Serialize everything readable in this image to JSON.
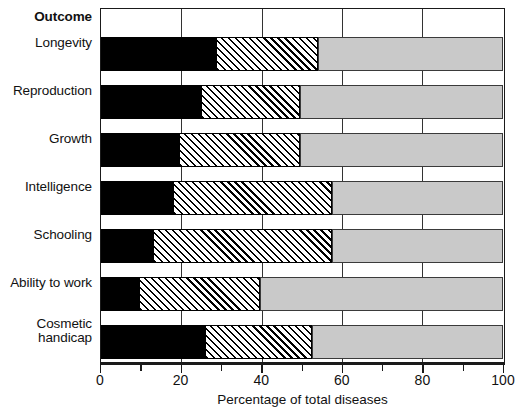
{
  "chart_data": {
    "type": "bar",
    "subtype": "horizontal-stacked",
    "title": "",
    "xlabel": "Percentage of total diseases",
    "ylabel": "Outcome",
    "categories": [
      "Longevity",
      "Reproduction",
      "Growth",
      "Intelligence",
      "Schooling",
      "Ability to work",
      "Cosmetic\nhandicap"
    ],
    "series": [
      {
        "name": "segment-1-solid-black",
        "fill": "solid-black",
        "color": "#000000",
        "values": [
          28.5,
          25.0,
          19.5,
          18.0,
          13.0,
          9.5,
          26.0
        ]
      },
      {
        "name": "segment-2-diagonal-hatch",
        "fill": "diagonal-hatch",
        "color": "#ffffff",
        "values": [
          25.5,
          24.5,
          30.0,
          39.5,
          44.5,
          30.0,
          26.5
        ]
      },
      {
        "name": "segment-3-light-gray",
        "fill": "light-gray",
        "color": "#c9c9c9",
        "values": [
          46.0,
          50.5,
          50.5,
          42.5,
          42.5,
          60.5,
          47.5
        ]
      }
    ],
    "cumulative_boundaries": [
      [
        28.5,
        54.0,
        100.0
      ],
      [
        25.0,
        49.5,
        100.0
      ],
      [
        19.5,
        49.5,
        100.0
      ],
      [
        18.0,
        57.5,
        100.0
      ],
      [
        13.0,
        57.5,
        100.0
      ],
      [
        9.5,
        39.5,
        100.0
      ],
      [
        26.0,
        52.5,
        100.0
      ]
    ],
    "xlim": [
      0,
      100
    ],
    "xticks": [
      0,
      20,
      40,
      60,
      80,
      100
    ],
    "xticklabels": [
      "0",
      "20",
      "40",
      "60",
      "80",
      "100"
    ],
    "xminorticks": [
      10,
      30,
      50,
      70,
      90
    ],
    "gridlines": [
      20,
      40,
      60,
      80
    ],
    "grid": true,
    "legend": "none",
    "legend_position": "none"
  },
  "axis": {
    "header_label": "Outcome",
    "x_title": "Percentage of total diseases",
    "tick_labels": [
      "0",
      "20",
      "40",
      "60",
      "80",
      "100"
    ]
  },
  "colors": {
    "solid": "#000000",
    "hatch_bg": "#ffffff",
    "gray": "#c9c9c9",
    "frame": "#1a1a1a",
    "text": "#111111"
  }
}
